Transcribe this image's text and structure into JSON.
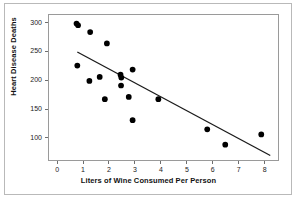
{
  "chart_data": {
    "type": "scatter",
    "title": "",
    "xlabel": "Liters of Wine Consumed Per Person",
    "ylabel": "Heart Disease Deaths",
    "xlim": [
      -0.35,
      8.55
    ],
    "ylim": [
      60,
      315
    ],
    "xticks": [
      0,
      1,
      2,
      3,
      4,
      5,
      6,
      7,
      8
    ],
    "xtick_labels": [
      "0",
      "1",
      "2",
      "3",
      "4",
      "5",
      "6",
      "7",
      "8"
    ],
    "yticks": [
      100,
      150,
      200,
      250,
      300
    ],
    "ytick_labels": [
      "100",
      "150",
      "200",
      "250",
      "300"
    ],
    "grid": false,
    "legend": null,
    "marker_color": "#000000",
    "marker_size": 4.2,
    "line_color": "#1a1a1a",
    "points": [
      {
        "x": 0.72,
        "y": 300
      },
      {
        "x": 0.78,
        "y": 297
      },
      {
        "x": 0.75,
        "y": 226
      },
      {
        "x": 1.25,
        "y": 285
      },
      {
        "x": 1.22,
        "y": 199
      },
      {
        "x": 1.62,
        "y": 206
      },
      {
        "x": 1.82,
        "y": 167
      },
      {
        "x": 1.9,
        "y": 265
      },
      {
        "x": 2.43,
        "y": 210
      },
      {
        "x": 2.46,
        "y": 205
      },
      {
        "x": 2.45,
        "y": 191
      },
      {
        "x": 2.75,
        "y": 171
      },
      {
        "x": 2.9,
        "y": 219
      },
      {
        "x": 2.9,
        "y": 130
      },
      {
        "x": 3.9,
        "y": 167
      },
      {
        "x": 5.8,
        "y": 114
      },
      {
        "x": 6.5,
        "y": 87
      },
      {
        "x": 7.9,
        "y": 105
      }
    ],
    "trendline": {
      "x_start": 0.75,
      "y_start": 250,
      "x_end": 8.25,
      "y_end": 68,
      "slope": -24.3,
      "intercept": 268.2
    }
  }
}
